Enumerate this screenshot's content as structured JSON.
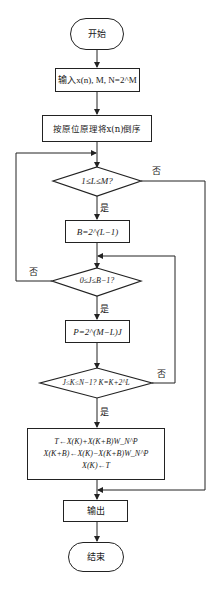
{
  "flowchart": {
    "start": "开始",
    "input": "输入x(n), M, N=2^M",
    "bit_reverse": "按原位原理将x(n)倒序",
    "cond_L": "1≤L≤M?",
    "set_B": "B=2^(L−1)",
    "cond_J": "0≤J≤B−1?",
    "set_P": "P=2^(M−L)J",
    "cond_K": "J≤K≤N−1? K=K+2^L",
    "butterfly": [
      "T←X(K)+X(K+B)W_N^P",
      "X(K+B)←X(K)−X(K+B)W_N^P",
      "X(K)←T"
    ],
    "output": "输出",
    "end": "结束",
    "labels": {
      "yes_1": "是",
      "no_1": "否",
      "yes_2": "是",
      "no_2": "否",
      "yes_3": "是",
      "no_3": "否"
    }
  },
  "colors": {
    "stroke": "#222222",
    "background": "#ffffff",
    "text": "#1a1a1a"
  }
}
